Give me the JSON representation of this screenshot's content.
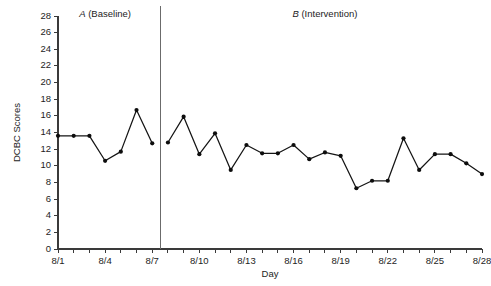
{
  "chart_data": {
    "type": "line",
    "title": "",
    "xlabel": "Day",
    "ylabel": "DCBC Scores",
    "ylim": [
      0,
      28
    ],
    "ytick_step": 2,
    "yticks": [
      0,
      2,
      4,
      6,
      8,
      10,
      12,
      14,
      16,
      18,
      20,
      22,
      24,
      26,
      28
    ],
    "ytick_labels": [
      "0",
      "2",
      "4",
      "6",
      "8",
      "10",
      "12",
      "14",
      "16",
      "18",
      "20",
      "22",
      "24",
      "26",
      "28"
    ],
    "grid": false,
    "legend": "none",
    "marker": "filled-circle",
    "x": [
      "8/1",
      "8/2",
      "8/3",
      "8/4",
      "8/5",
      "8/6",
      "8/7",
      "8/8",
      "8/9",
      "8/10",
      "8/11",
      "8/12",
      "8/13",
      "8/14",
      "8/15",
      "8/16",
      "8/17",
      "8/18",
      "8/19",
      "8/20",
      "8/21",
      "8/22",
      "8/23",
      "8/24",
      "8/25",
      "8/26",
      "8/27",
      "8/28"
    ],
    "xtick_labels": [
      "8/1",
      "",
      "",
      "8/4",
      "",
      "",
      "8/7",
      "",
      "",
      "8/10",
      "",
      "",
      "8/13",
      "",
      "",
      "8/16",
      "",
      "",
      "8/19",
      "",
      "",
      "8/22",
      "",
      "",
      "8/25",
      "",
      "",
      "8/28"
    ],
    "series": [
      {
        "name": "DCBC Scores",
        "values": [
          13.6,
          13.6,
          13.6,
          10.6,
          11.7,
          16.7,
          12.7,
          12.8,
          15.9,
          11.4,
          13.9,
          9.5,
          12.5,
          11.5,
          11.5,
          12.5,
          10.8,
          11.6,
          11.2,
          7.3,
          8.2,
          8.2,
          13.3,
          9.5,
          11.4,
          11.4,
          10.3,
          9.0
        ]
      }
    ],
    "phases": [
      {
        "letter": "A",
        "label": "(Baseline)",
        "full_label": "A (Baseline)",
        "start_index": 0,
        "end_index": 6
      },
      {
        "letter": "B",
        "label": "(Intervention)",
        "full_label": "B (Intervention)",
        "start_index": 7,
        "end_index": 27
      }
    ],
    "phase_divider_after_index": 6,
    "colors": {
      "line": "#141414",
      "marker": "#0d0d0d",
      "axis": "#3a3a3a",
      "phase_divider": "#6b6b6b",
      "background": "#ffffff",
      "text": "#1d1d1d"
    }
  }
}
